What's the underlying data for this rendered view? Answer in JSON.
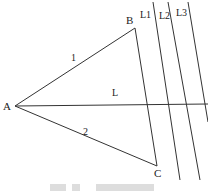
{
  "diagram": {
    "points": {
      "A": {
        "label": "A",
        "x": 15,
        "y": 106
      },
      "B": {
        "label": "B",
        "x": 135,
        "y": 28
      },
      "C": {
        "label": "C",
        "x": 157,
        "y": 166
      }
    },
    "segments": [
      {
        "id": "AB",
        "label": "1",
        "x1": 15,
        "y1": 106,
        "x2": 135,
        "y2": 28
      },
      {
        "id": "AC",
        "label": "2",
        "x1": 15,
        "y1": 106,
        "x2": 157,
        "y2": 166
      },
      {
        "id": "BC",
        "label": "",
        "x1": 135,
        "y1": 28,
        "x2": 157,
        "y2": 166
      }
    ],
    "lines": [
      {
        "id": "L",
        "label": "L",
        "x1": 15,
        "y1": 106,
        "x2": 208,
        "y2": 104
      },
      {
        "id": "L1",
        "label": "L1",
        "x1": 153,
        "y1": 2,
        "x2": 180,
        "y2": 180
      },
      {
        "id": "L2",
        "label": "L2",
        "x1": 168,
        "y1": 2,
        "x2": 200,
        "y2": 180
      },
      {
        "id": "L3",
        "label": "L3",
        "x1": 188,
        "y1": 2,
        "x2": 208,
        "y2": 122
      }
    ],
    "labels": {
      "A": "A",
      "B": "B",
      "C": "C",
      "seg1": "1",
      "seg2": "2",
      "L": "L",
      "L1": "L1",
      "L2": "L2",
      "L3": "L3"
    },
    "stroke_color": "#333333"
  },
  "caption": {
    "text": ""
  }
}
